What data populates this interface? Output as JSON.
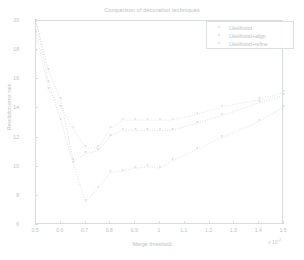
{
  "chart_data": {
    "type": "line",
    "title": "Comparison of decoration techniques",
    "xlabel": "Merge threshold",
    "ylabel": "Resolution error rate",
    "x_exponent_label": "x 10",
    "x_exponent_power": "-2",
    "xlim": [
      0.5,
      1.5
    ],
    "ylim": [
      6,
      20
    ],
    "xticks": [
      "0.5",
      "0.6",
      "0.7",
      "0.8",
      "0.9",
      "1",
      "1.1",
      "1.2",
      "1.3",
      "1.4",
      "1.5"
    ],
    "yticks": [
      "6",
      "8",
      "10",
      "12",
      "14",
      "16",
      "18",
      "20"
    ],
    "grid": false,
    "legend_position": "top-right",
    "linestyle": "dotted",
    "marker": "asterisk",
    "series": [
      {
        "name": "Likelihood",
        "color": "#c9ccd0",
        "marker": "*",
        "x": [
          0.5,
          0.55,
          0.6,
          0.65,
          0.7,
          0.75,
          0.8,
          0.85,
          0.9,
          0.95,
          1.0,
          1.05,
          1.15,
          1.25,
          1.4,
          1.5
        ],
        "values": [
          19.2,
          15.3,
          14.1,
          12.6,
          11.3,
          11.3,
          12.6,
          13.2,
          13.2,
          13.2,
          13.2,
          13.2,
          13.6,
          14.1,
          14.6,
          15.1
        ]
      },
      {
        "name": "Likelihood+align",
        "color": "#bfc3c8",
        "marker": "*",
        "x": [
          0.5,
          0.55,
          0.6,
          0.65,
          0.7,
          0.75,
          0.8,
          0.85,
          0.9,
          0.95,
          1.0,
          1.05,
          1.15,
          1.25,
          1.4,
          1.5
        ],
        "values": [
          20.0,
          16.6,
          14.6,
          10.4,
          10.9,
          11.1,
          12.1,
          12.5,
          12.5,
          12.5,
          12.5,
          12.5,
          13.0,
          13.5,
          14.4,
          14.9
        ]
      },
      {
        "name": "Likelihood+refine",
        "color": "#c4c8cc",
        "marker": "*",
        "x": [
          0.5,
          0.55,
          0.6,
          0.65,
          0.7,
          0.75,
          0.8,
          0.85,
          0.9,
          0.95,
          1.0,
          1.05,
          1.15,
          1.25,
          1.4,
          1.5
        ],
        "values": [
          20.0,
          15.8,
          13.2,
          10.2,
          7.6,
          8.5,
          9.6,
          9.7,
          9.9,
          10.0,
          9.9,
          10.4,
          11.2,
          12.0,
          13.1,
          14.1
        ]
      }
    ]
  },
  "legend": {
    "entries": [
      {
        "label": "Likelihood",
        "marker": "*"
      },
      {
        "label": "Likelihood+align",
        "marker": "*"
      },
      {
        "label": "Likelihood+refine",
        "marker": "*"
      }
    ]
  }
}
